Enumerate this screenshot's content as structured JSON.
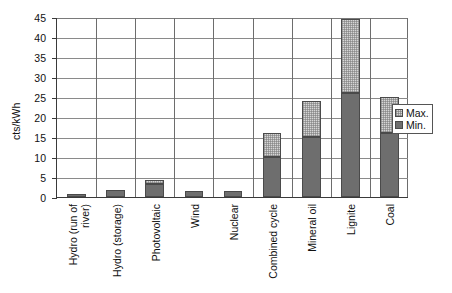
{
  "chart_data": {
    "type": "bar",
    "stacked": true,
    "title": "",
    "xlabel": "",
    "ylabel": "cts/kWh",
    "ylim": [
      0,
      45
    ],
    "yticks": [
      0,
      5,
      10,
      15,
      20,
      25,
      30,
      35,
      40,
      45
    ],
    "grid": true,
    "legend_position": "right",
    "categories": [
      "Hydro (run of\nriver)",
      "Hydro (storage)",
      "Photovoltaic",
      "Wind",
      "Nuclear",
      "Combined cycle",
      "Mineral oil",
      "Lignite",
      "Coal"
    ],
    "series": [
      {
        "name": "Min.",
        "color": "#6e6e6e",
        "values": [
          0.8,
          1.8,
          3.3,
          1.4,
          1.4,
          10.0,
          15.0,
          26.0,
          16.0
        ]
      },
      {
        "name": "Max.",
        "color": "#d6d6d6",
        "values": [
          0.8,
          1.8,
          4.3,
          1.4,
          1.4,
          16.0,
          24.0,
          44.5,
          25.0
        ]
      }
    ]
  },
  "legend": {
    "items": [
      {
        "label": "Max.",
        "swatch": "max"
      },
      {
        "label": "Min.",
        "swatch": "min"
      }
    ]
  }
}
